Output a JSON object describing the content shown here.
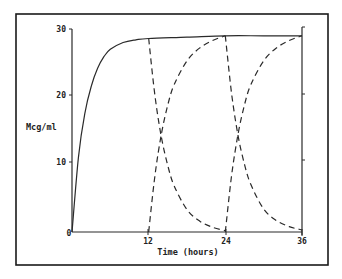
{
  "chart_data": {
    "type": "line",
    "title": "",
    "xlabel": "Time (hours)",
    "ylabel": "Mcg/ml",
    "xlim": [
      0,
      36
    ],
    "ylim": [
      0,
      30
    ],
    "x_ticks": [
      0,
      12,
      24,
      36
    ],
    "x_tick_labels": [
      "0",
      "12",
      "24",
      "36"
    ],
    "y_ticks": [
      0,
      10,
      20,
      30
    ],
    "y_tick_labels": [
      "0",
      "10",
      "20",
      "30"
    ],
    "grid": false,
    "legend": null,
    "series": [
      {
        "name": "cumulative concentration",
        "style": "solid",
        "x": [
          0,
          1,
          2,
          3,
          4,
          5,
          6,
          8,
          10,
          12,
          18,
          24,
          30,
          36
        ],
        "y": [
          0,
          11,
          17.5,
          21.5,
          24.2,
          25.9,
          27,
          28,
          28.4,
          28.6,
          28.8,
          29,
          29,
          29
        ]
      },
      {
        "name": "dose 1 elimination",
        "style": "dashed",
        "x": [
          12,
          13,
          14,
          15,
          16,
          18,
          20,
          22,
          24
        ],
        "y": [
          28.6,
          20,
          14,
          9.8,
          6.8,
          3.3,
          1.6,
          0.7,
          0.2
        ]
      },
      {
        "name": "dose 2 absorption",
        "style": "dashed",
        "x": [
          12,
          13,
          14,
          15,
          16,
          18,
          20,
          22,
          24
        ],
        "y": [
          0,
          8.5,
          14.5,
          18.8,
          21.8,
          25.3,
          27.2,
          28.3,
          29
        ]
      },
      {
        "name": "dose 2 elimination",
        "style": "dashed",
        "x": [
          24,
          25,
          26,
          27,
          28,
          30,
          32,
          34,
          36
        ],
        "y": [
          29,
          20.3,
          14.2,
          10,
          7,
          3.4,
          1.7,
          0.8,
          0.3
        ]
      },
      {
        "name": "dose 3 absorption",
        "style": "dashed",
        "x": [
          24,
          25,
          26,
          27,
          28,
          30,
          32,
          34,
          36
        ],
        "y": [
          0,
          8.5,
          14.5,
          18.8,
          21.8,
          25.3,
          27.2,
          28.3,
          29
        ]
      }
    ]
  },
  "axes": {
    "x_title": "Time (hours)",
    "y_title": "Mcg/ml",
    "x_tick_labels": [
      "0",
      "12",
      "24",
      "36"
    ],
    "y_tick_labels": [
      "0",
      "10",
      "20",
      "30"
    ]
  },
  "colors": {
    "line": "#2a2a2a",
    "frame": "#1a1a1a",
    "background": "#ffffff"
  }
}
